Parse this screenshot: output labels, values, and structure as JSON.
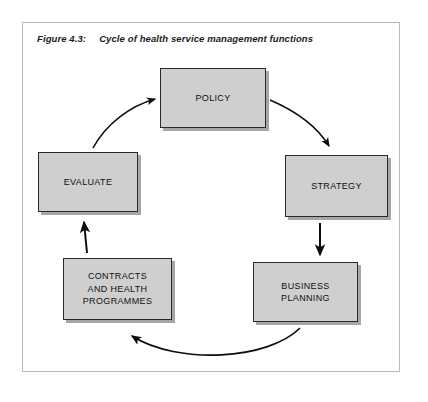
{
  "figure": {
    "label": "Figure 4.3:",
    "title": "Cycle of health service management functions"
  },
  "diagram": {
    "type": "cycle",
    "direction": "clockwise",
    "nodes": [
      {
        "id": "policy",
        "label": "POLICY"
      },
      {
        "id": "strategy",
        "label": "STRATEGY"
      },
      {
        "id": "business",
        "label": "BUSINESS\nPLANNING"
      },
      {
        "id": "contracts",
        "label": "CONTRACTS\nAND HEALTH\nPROGRAMMES"
      },
      {
        "id": "evaluate",
        "label": "EVALUATE"
      }
    ],
    "edges": [
      {
        "from": "policy",
        "to": "strategy",
        "style": "curved"
      },
      {
        "from": "strategy",
        "to": "business",
        "style": "straight"
      },
      {
        "from": "business",
        "to": "contracts",
        "style": "curved"
      },
      {
        "from": "contracts",
        "to": "evaluate",
        "style": "straight"
      },
      {
        "from": "evaluate",
        "to": "policy",
        "style": "curved"
      }
    ],
    "colors": {
      "box_fill": "#cfcfcf",
      "box_border": "#2a2a2a",
      "box_shadow": "#969696",
      "arrow": "#0d0d0d",
      "frame_border": "#b9b9b9",
      "background": "#ffffff",
      "text": "#0f0f0f"
    }
  }
}
